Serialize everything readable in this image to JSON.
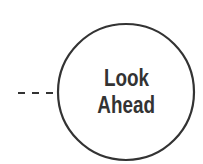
{
  "diagram": {
    "node": {
      "shape": "circle",
      "label_lines": [
        "Look",
        "Ahead"
      ],
      "stroke_color": "#333333",
      "fill_color": "#ffffff",
      "text_color": "#333333"
    },
    "connector": {
      "style": "dashed",
      "direction": "from-left",
      "color": "#333333"
    }
  }
}
